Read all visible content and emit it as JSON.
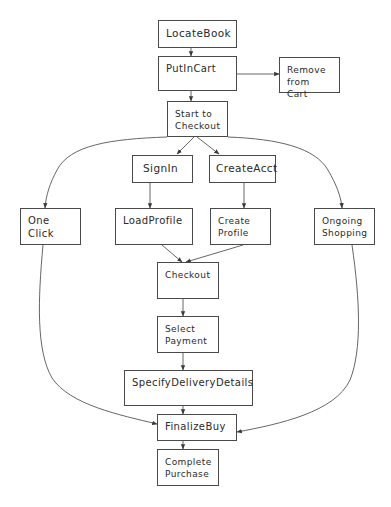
{
  "diagram": {
    "type": "flowchart",
    "nodes": [
      {
        "id": "locate-book",
        "label": "LocateBook",
        "x": 158,
        "y": 20,
        "w": 79,
        "h": 28
      },
      {
        "id": "put-in-cart",
        "label": "PutInCart",
        "x": 158,
        "y": 56,
        "w": 79,
        "h": 35
      },
      {
        "id": "remove-from-cart",
        "label": "Remove\nfrom Cart",
        "x": 279,
        "y": 57,
        "w": 61,
        "h": 36
      },
      {
        "id": "start-to-checkout",
        "label": "Start to\nCheckout",
        "x": 167,
        "y": 101,
        "w": 61,
        "h": 36
      },
      {
        "id": "sign-in",
        "label": "SignIn",
        "x": 132,
        "y": 155,
        "w": 61,
        "h": 28
      },
      {
        "id": "create-acct",
        "label": "CreateAcct",
        "x": 209,
        "y": 155,
        "w": 67,
        "h": 28
      },
      {
        "id": "one-click",
        "label": "One\nClick",
        "x": 20,
        "y": 208,
        "w": 61,
        "h": 37
      },
      {
        "id": "load-profile",
        "label": "LoadProfile",
        "x": 115,
        "y": 208,
        "w": 78,
        "h": 37
      },
      {
        "id": "create-profile",
        "label": "Create\nProfile",
        "x": 210,
        "y": 208,
        "w": 61,
        "h": 37
      },
      {
        "id": "ongoing-shopping",
        "label": "Ongoing\nShopping",
        "x": 314,
        "y": 208,
        "w": 61,
        "h": 37
      },
      {
        "id": "checkout",
        "label": "Checkout",
        "x": 157,
        "y": 262,
        "w": 62,
        "h": 37
      },
      {
        "id": "select-payment",
        "label": "Select\nPayment",
        "x": 157,
        "y": 316,
        "w": 62,
        "h": 37
      },
      {
        "id": "specify-delivery-details",
        "label": "SpecifyDeliveryDetails",
        "x": 124,
        "y": 370,
        "w": 129,
        "h": 36
      },
      {
        "id": "finalize-buy",
        "label": "FinalizeBuy",
        "x": 157,
        "y": 414,
        "w": 80,
        "h": 27
      },
      {
        "id": "complete-purchase",
        "label": "Complete\nPurchase",
        "x": 157,
        "y": 449,
        "w": 62,
        "h": 37
      }
    ],
    "edges": [
      {
        "from": "locate-book",
        "to": "put-in-cart"
      },
      {
        "from": "put-in-cart",
        "to": "remove-from-cart"
      },
      {
        "from": "put-in-cart",
        "to": "start-to-checkout"
      },
      {
        "from": "start-to-checkout",
        "to": "sign-in"
      },
      {
        "from": "start-to-checkout",
        "to": "create-acct"
      },
      {
        "from": "start-to-checkout",
        "to": "one-click"
      },
      {
        "from": "start-to-checkout",
        "to": "ongoing-shopping"
      },
      {
        "from": "sign-in",
        "to": "load-profile"
      },
      {
        "from": "create-acct",
        "to": "create-profile"
      },
      {
        "from": "load-profile",
        "to": "checkout"
      },
      {
        "from": "create-profile",
        "to": "checkout"
      },
      {
        "from": "checkout",
        "to": "select-payment"
      },
      {
        "from": "select-payment",
        "to": "specify-delivery-details"
      },
      {
        "from": "specify-delivery-details",
        "to": "finalize-buy"
      },
      {
        "from": "one-click",
        "to": "finalize-buy"
      },
      {
        "from": "ongoing-shopping",
        "to": "finalize-buy"
      },
      {
        "from": "finalize-buy",
        "to": "complete-purchase"
      }
    ],
    "colors": {
      "stroke": "#4a4a4a",
      "text": "#2a2a2a",
      "background": "#ffffff"
    }
  },
  "labels": {
    "locate_book": "LocateBook",
    "put_in_cart": "PutInCart",
    "remove_from_cart": "Remove\nfrom Cart",
    "start_to_checkout": "Start to\nCheckout",
    "sign_in": "SignIn",
    "create_acct": "CreateAcct",
    "one_click": "One\nClick",
    "load_profile": "LoadProfile",
    "create_profile": "Create\nProfile",
    "ongoing_shopping": "Ongoing\nShopping",
    "checkout": "Checkout",
    "select_payment": "Select\nPayment",
    "specify_delivery_details": "SpecifyDeliveryDetails",
    "finalize_buy": "FinalizeBuy",
    "complete_purchase": "Complete\nPurchase"
  }
}
